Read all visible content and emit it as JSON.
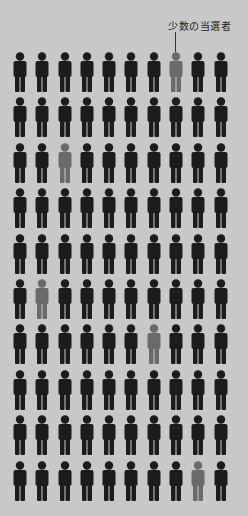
{
  "annotation": {
    "label": "少数の当選者"
  },
  "colors": {
    "background": "#c8c8c8",
    "majority": "#1c1c1c",
    "minority": "#6a6a6a"
  },
  "grid": {
    "rows": 10,
    "cols": 10,
    "highlighted": [
      {
        "row": 0,
        "col": 7
      },
      {
        "row": 2,
        "col": 2
      },
      {
        "row": 5,
        "col": 1
      },
      {
        "row": 6,
        "col": 6
      },
      {
        "row": 9,
        "col": 8
      }
    ]
  }
}
